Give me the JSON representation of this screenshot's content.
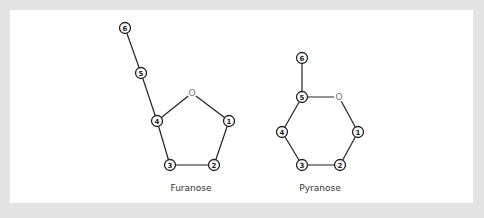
{
  "diagram": {
    "structures": [
      {
        "name": "Furanose",
        "label": "Furanose",
        "ring_oxygen": {
          "label": "O",
          "x": 192,
          "y": 93
        },
        "nodes": [
          {
            "id": "1",
            "label": "1",
            "x": 229,
            "y": 121
          },
          {
            "id": "2",
            "label": "2",
            "x": 214,
            "y": 165
          },
          {
            "id": "3",
            "label": "3",
            "x": 170,
            "y": 165
          },
          {
            "id": "4",
            "label": "4",
            "x": 157,
            "y": 121
          },
          {
            "id": "5",
            "label": "5",
            "x": 141,
            "y": 73
          },
          {
            "id": "6",
            "label": "6",
            "x": 125,
            "y": 28
          }
        ],
        "bonds": [
          [
            "O",
            "1"
          ],
          [
            "1",
            "2"
          ],
          [
            "2",
            "3"
          ],
          [
            "3",
            "4"
          ],
          [
            "4",
            "O"
          ],
          [
            "4",
            "5"
          ],
          [
            "5",
            "6"
          ]
        ],
        "caption_pos": {
          "x": 191,
          "y": 191
        }
      },
      {
        "name": "Pyranose",
        "label": "Pyranose",
        "ring_oxygen": {
          "label": "O",
          "x": 339,
          "y": 97
        },
        "nodes": [
          {
            "id": "1",
            "label": "1",
            "x": 358,
            "y": 132
          },
          {
            "id": "2",
            "label": "2",
            "x": 340,
            "y": 165
          },
          {
            "id": "3",
            "label": "3",
            "x": 302,
            "y": 165
          },
          {
            "id": "4",
            "label": "4",
            "x": 282,
            "y": 132
          },
          {
            "id": "5",
            "label": "5",
            "x": 302,
            "y": 97
          },
          {
            "id": "6",
            "label": "6",
            "x": 302,
            "y": 58
          }
        ],
        "bonds": [
          [
            "5",
            "O"
          ],
          [
            "O",
            "1"
          ],
          [
            "1",
            "2"
          ],
          [
            "2",
            "3"
          ],
          [
            "3",
            "4"
          ],
          [
            "4",
            "5"
          ],
          [
            "5",
            "6"
          ]
        ],
        "caption_pos": {
          "x": 320,
          "y": 191
        }
      }
    ]
  }
}
